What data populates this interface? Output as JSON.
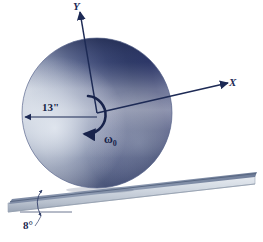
{
  "labels": {
    "axis_y": "Y",
    "axis_x": "X",
    "radius": "13\"",
    "omega": "ω",
    "omega_subscript": "0",
    "incline_angle": "8°"
  },
  "icons": {
    "y_axis": "y-axis-arrow-icon",
    "x_axis": "x-axis-arrow-icon",
    "rotation": "angular-velocity-arrow-icon",
    "radius_dimension": "radius-dimension-arrow-icon",
    "angle_dimension": "angle-dimension-arc-icon"
  },
  "geometry": {
    "disk_center_x": 97,
    "disk_center_y": 113,
    "disk_radius": 75,
    "incline_angle_degrees": 8,
    "radius_value_inches": 13
  },
  "colors": {
    "disk_dark": "#2b3566",
    "disk_mid": "#7d89a8",
    "disk_light": "#ced6e2",
    "disk_outline": "#55608a",
    "axis_line": "#1d2a55",
    "ramp_top": "#97a3b8",
    "ramp_face": "#cfd6df",
    "ramp_edge": "#5d6b84",
    "background": "#ffffff",
    "label_text": "#1d2a55"
  }
}
